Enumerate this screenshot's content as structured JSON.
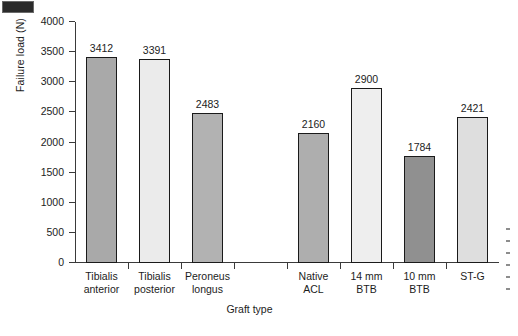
{
  "chart_data": {
    "type": "bar",
    "title": "",
    "subtitle": "",
    "xlabel": "Graft type",
    "ylabel": "Failure load (N)",
    "ylim": [
      0,
      4000
    ],
    "ytick_labels": [
      "0",
      "500",
      "1000",
      "1500",
      "2000",
      "2500",
      "3000",
      "3500",
      "4000"
    ],
    "ytick_values": [
      0,
      500,
      1000,
      1500,
      2000,
      2500,
      3000,
      3500,
      4000
    ],
    "grid": false,
    "legend": "none",
    "value_labels_shown": true,
    "categories": [
      "Tibialis anterior",
      "Tibialis posterior",
      "Peroneus longus",
      "",
      "Native ACL",
      "14 mm BTB",
      "10 mm BTB",
      "ST-G"
    ],
    "category_lines": [
      [
        "Tibialis",
        "anterior"
      ],
      [
        "Tibialis",
        "posterior"
      ],
      [
        "Peroneus",
        "longus"
      ],
      [
        "",
        ""
      ],
      [
        "Native",
        "ACL"
      ],
      [
        "14 mm",
        "BTB"
      ],
      [
        "10 mm",
        "BTB"
      ],
      [
        "ST-G",
        ""
      ]
    ],
    "values": [
      3412,
      3391,
      2483,
      null,
      2160,
      2900,
      1784,
      2421
    ],
    "value_labels": [
      "3412",
      "3391",
      "2483",
      "",
      "2160",
      "2900",
      "1784",
      "2421"
    ],
    "bar_colors": [
      "#a9a9a9",
      "#ebebeb",
      "#b2b2b2",
      "none",
      "#aeaeae",
      "#eeeeee",
      "#909090",
      "#dedede"
    ],
    "bar_edge_color": "#1a1a1a",
    "axis_color": "#3a3a3a",
    "text_color": "#1c1c1c",
    "background": "#ffffff"
  },
  "artifacts": {
    "corner_mark_color": "#2b2b2b",
    "caption_sliver_lines": 6
  }
}
